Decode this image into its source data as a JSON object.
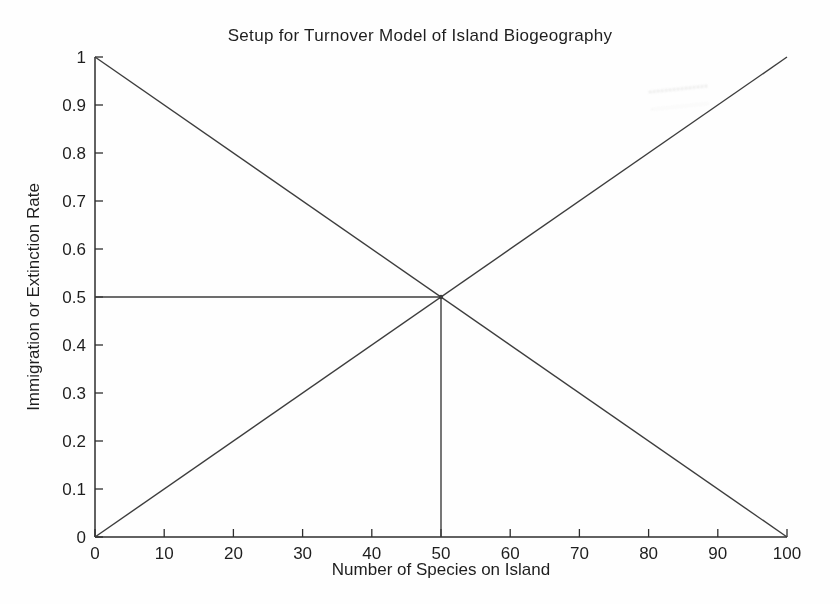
{
  "chart_data": {
    "type": "line",
    "title": "Setup for Turnover Model of Island Biogeography",
    "xlabel": "Number of Species on Island",
    "ylabel": "Immigration or Extinction Rate",
    "xlim": [
      0,
      100
    ],
    "ylim": [
      0,
      1
    ],
    "xticks": [
      0,
      10,
      20,
      30,
      40,
      50,
      60,
      70,
      80,
      90,
      100
    ],
    "xtick_labels": [
      "0",
      "10",
      "20",
      "30",
      "40",
      "50",
      "60",
      "70",
      "80",
      "90",
      "100"
    ],
    "yticks": [
      0,
      0.1,
      0.2,
      0.3,
      0.4,
      0.5,
      0.6,
      0.7,
      0.8,
      0.9,
      1
    ],
    "ytick_labels": [
      "0",
      "0.1",
      "0.2",
      "0.3",
      "0.4",
      "0.5",
      "0.6",
      "0.7",
      "0.8",
      "0.9",
      "1"
    ],
    "grid": false,
    "box": false,
    "legend": "none",
    "series": [
      {
        "name": "immigration-rate",
        "x": [
          0,
          100
        ],
        "y": [
          1,
          0
        ]
      },
      {
        "name": "extinction-rate",
        "x": [
          0,
          100
        ],
        "y": [
          0,
          1
        ]
      },
      {
        "name": "equilibrium-horizontal-reference",
        "x": [
          0,
          50
        ],
        "y": [
          0.5,
          0.5
        ]
      },
      {
        "name": "equilibrium-vertical-reference",
        "x": [
          50,
          50
        ],
        "y": [
          0,
          0.5
        ]
      }
    ],
    "equilibrium_point": {
      "x": 50,
      "y": 0.5
    }
  },
  "style": {
    "line_color": "#3d3d3d",
    "axis_color": "#2e2e2e",
    "text_color": "#1e1e1e",
    "background": "#fefefe"
  }
}
